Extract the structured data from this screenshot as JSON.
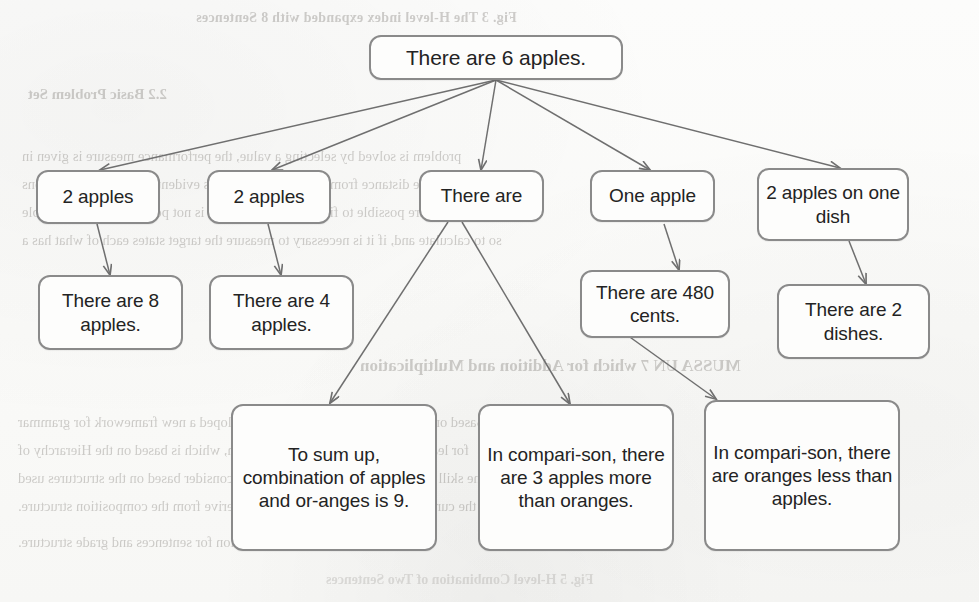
{
  "figure": {
    "type": "tree-diagram",
    "top_caption": "Fig. 3 The H-level index expanded with 8 Sentences",
    "bottom_caption": "Fig. 5 H-level Combination of Two Sentences",
    "section_heading_bleed": "MUSSA UN 7 which for Addition and Multiplication",
    "subsection_bleed": "2.2   Basic Problem Set",
    "body_bleed_lines": [
      "problem is solved by selecting a value, the performance measure is given in",
      "form of the distance from the desired state. It is evident that in many situations",
      "even if it were possible to find such a state, yet it is not possible, it is not feasible",
      "so to calculate and, if it is necessary to measure the target states each of what has a",
      "Based on the tree of the trees, we have developed a new framework for grammar",
      "for learning the sentences for the children, which is based on the Hierarchy of",
      "the skill of NLP. At the same time, we also consider based on the structures used",
      "in the current state of the art which we can derive from the composition structure.",
      "we must use the proper function for sentences and grade structure."
    ]
  },
  "nodes": {
    "root": "There are 6 apples.",
    "level2": [
      "2 apples",
      "2 apples",
      "There are",
      "One apple",
      "2 apples on one dish"
    ],
    "level3": [
      "There are 8 apples.",
      "There are 4 apples.",
      "There are 480 cents.",
      "There are 2 dishes."
    ],
    "level4": [
      "To sum up, combination of apples and or-anges is 9.",
      "In compari-son, there are 3 apples more than oranges.",
      "In compari-son, there are oranges less than apples."
    ]
  },
  "colors": {
    "node_border": "#8a8a8a",
    "node_fill": "#fdfdfc",
    "edge": "#6f6f6f",
    "text": "#232323",
    "page": "#fbfbfa",
    "bleed_text": "#5a554f"
  }
}
